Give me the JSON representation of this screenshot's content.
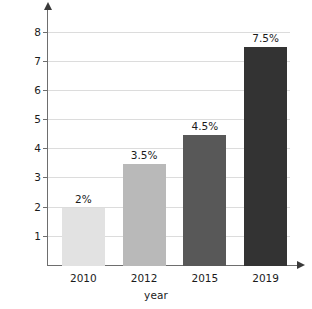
{
  "chart_data": {
    "type": "bar",
    "title": "",
    "xlabel": "year",
    "ylabel": "percentage of deposits",
    "categories": [
      "2010",
      "2012",
      "2015",
      "2019"
    ],
    "values": [
      2,
      3.5,
      4.5,
      7.5
    ],
    "data_labels": [
      "2%",
      "3.5%",
      "4.5%",
      "7.5%"
    ],
    "ylim": [
      0,
      8.5
    ],
    "yticks": [
      1,
      2,
      3,
      4,
      5,
      6,
      7,
      8
    ],
    "ytick_labels": [
      "1",
      "2",
      "3",
      "4",
      "5",
      "6",
      "7",
      "8"
    ],
    "grid": true,
    "legend": false,
    "bar_colors": [
      "#e2e2e2",
      "#b9b9b9",
      "#585858",
      "#333333"
    ],
    "axis_color": "#6e6e6e",
    "grid_color": "#dcdcdc",
    "text_color": "#1b1b1b"
  }
}
